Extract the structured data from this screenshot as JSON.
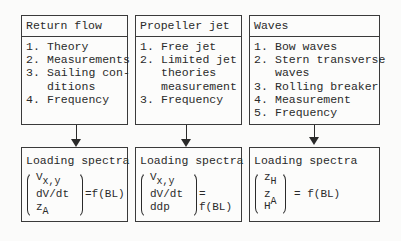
{
  "columns": [
    {
      "title": "Return flow",
      "items": [
        {
          "num": "1.",
          "text": "Theory"
        },
        {
          "num": "2.",
          "text": "Measurements"
        },
        {
          "num": "3.",
          "text": "Sailing con-"
        },
        {
          "num": "",
          "text": "ditions"
        },
        {
          "num": "4.",
          "text": "Frequency"
        }
      ],
      "loading": {
        "title": "Loading spectra",
        "vector": [
          {
            "base": "V",
            "sub": "x,y"
          },
          {
            "base": "dV/dt",
            "sub": ""
          },
          {
            "base": "z",
            "sub": "A"
          }
        ],
        "equals": "=f(BL)"
      }
    },
    {
      "title": "Propeller jet",
      "items": [
        {
          "num": "1.",
          "text": "Free jet"
        },
        {
          "num": "2.",
          "text": "Limited jet"
        },
        {
          "num": "",
          "text": "theories"
        },
        {
          "num": "",
          "text": "measurement"
        },
        {
          "num": "3.",
          "text": "Frequency"
        }
      ],
      "loading": {
        "title": "Loading spectra",
        "vector": [
          {
            "base": "V",
            "sub": "x,y"
          },
          {
            "base": "dV/dt",
            "sub": ""
          },
          {
            "base": "ddp",
            "sub": ""
          }
        ],
        "equals": "= f(BL)"
      }
    },
    {
      "title": "Waves",
      "items": [
        {
          "num": "1.",
          "text": "Bow waves"
        },
        {
          "num": "2.",
          "text": "Stern transverse"
        },
        {
          "num": "",
          "text": "waves"
        },
        {
          "num": "3.",
          "text": "Rolling breaker"
        },
        {
          "num": "4.",
          "text": "Measurement"
        },
        {
          "num": "5.",
          "text": "Frequency"
        }
      ],
      "loading": {
        "title": "Loading spectra",
        "vector": [
          {
            "base": "z",
            "sub": "H"
          },
          {
            "base": "z",
            "sub": "A"
          },
          {
            "base": "H",
            "sub": ""
          }
        ],
        "equals": "= f(BL)"
      }
    }
  ]
}
